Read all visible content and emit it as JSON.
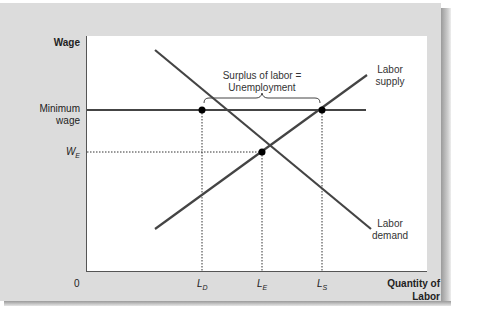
{
  "axes": {
    "y_label": "Wage",
    "x_label_line1": "Quantity of",
    "x_label_line2": "Labor",
    "origin": "0"
  },
  "y_ticks": {
    "min_wage_line1": "Minimum",
    "min_wage_line2": "wage",
    "we_main": "W",
    "we_sub": "E"
  },
  "x_ticks": {
    "ld_main": "L",
    "ld_sub": "D",
    "le_main": "L",
    "le_sub": "E",
    "ls_main": "L",
    "ls_sub": "S"
  },
  "curves": {
    "supply_line1": "Labor",
    "supply_line2": "supply",
    "demand_line1": "Labor",
    "demand_line2": "demand"
  },
  "annotation": {
    "line1": "Surplus of labor =",
    "line2": "Unemployment"
  },
  "colors": {
    "panel": "#dcdcdc",
    "curve": "#444444",
    "point": "#000000"
  }
}
